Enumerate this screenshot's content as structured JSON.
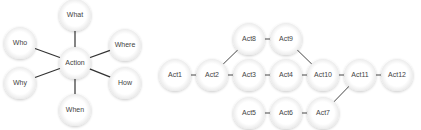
{
  "colors": {
    "background": "#ffffff",
    "node_fill": "#ffffff",
    "node_shadow": "#d9d9d9",
    "edge": "#333333",
    "text": "#444444"
  },
  "five_w_diagram": {
    "center": {
      "id": "action",
      "label": "Action",
      "x": 75,
      "y": 63
    },
    "spokes": [
      {
        "id": "what",
        "label": "What",
        "x": 75,
        "y": 15
      },
      {
        "id": "where",
        "label": "Where",
        "x": 125,
        "y": 45
      },
      {
        "id": "how",
        "label": "How",
        "x": 125,
        "y": 83
      },
      {
        "id": "when",
        "label": "When",
        "x": 75,
        "y": 110
      },
      {
        "id": "why",
        "label": "Why",
        "x": 20,
        "y": 83
      },
      {
        "id": "who",
        "label": "Who",
        "x": 20,
        "y": 43
      }
    ]
  },
  "activity_network": {
    "nodes": [
      {
        "id": "act1",
        "label": "Act1",
        "x": 175,
        "y": 75
      },
      {
        "id": "act2",
        "label": "Act2",
        "x": 212,
        "y": 75
      },
      {
        "id": "act3",
        "label": "Act3",
        "x": 249,
        "y": 75
      },
      {
        "id": "act4",
        "label": "Act4",
        "x": 286,
        "y": 75
      },
      {
        "id": "act5",
        "label": "Act5",
        "x": 249,
        "y": 113
      },
      {
        "id": "act6",
        "label": "Act6",
        "x": 286,
        "y": 113
      },
      {
        "id": "act7",
        "label": "Act7",
        "x": 323,
        "y": 113
      },
      {
        "id": "act8",
        "label": "Act8",
        "x": 249,
        "y": 39
      },
      {
        "id": "act9",
        "label": "Act9",
        "x": 286,
        "y": 39
      },
      {
        "id": "act10",
        "label": "Act10",
        "x": 323,
        "y": 75
      },
      {
        "id": "act11",
        "label": "Act11",
        "x": 360,
        "y": 75
      },
      {
        "id": "act12",
        "label": "Act12",
        "x": 397,
        "y": 75
      }
    ],
    "edges": [
      {
        "from": "act1",
        "to": "act2"
      },
      {
        "from": "act2",
        "to": "act3"
      },
      {
        "from": "act2",
        "to": "act8"
      },
      {
        "from": "act8",
        "to": "act9"
      },
      {
        "from": "act9",
        "to": "act10"
      },
      {
        "from": "act3",
        "to": "act4"
      },
      {
        "from": "act4",
        "to": "act10"
      },
      {
        "from": "act10",
        "to": "act11"
      },
      {
        "from": "act11",
        "to": "act12"
      },
      {
        "from": "act5",
        "to": "act6"
      },
      {
        "from": "act6",
        "to": "act7"
      },
      {
        "from": "act7",
        "to": "act11"
      }
    ]
  }
}
